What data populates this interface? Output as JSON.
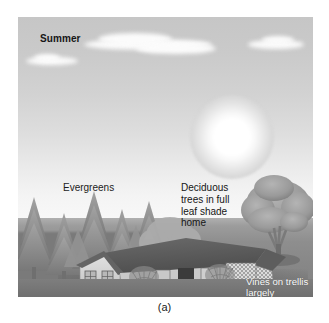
{
  "figure": {
    "caption": "(a)",
    "scene_name": "summer-passive-solar-landscaping"
  },
  "labels": {
    "season": "Summer",
    "evergreens": "Evergreens",
    "deciduous": "Deciduous\ntrees in full\nleaf shade\nhome",
    "vines": "Vines on trellis\nlargely covering\nfront of house"
  },
  "elements": {
    "sun": "sun",
    "clouds": "clouds",
    "sky": "sky",
    "ground": "ground",
    "evergreen_trees": "evergreen-tree-row",
    "deciduous_tree": "deciduous-tree",
    "house": "house",
    "trellis": "trellis"
  },
  "colors": {
    "sky_top": "#c6c6c6",
    "sky_horizon": "#f8f8f8",
    "sun": "#ffffff",
    "cloud": "#fbfbfb",
    "ground": "#8e8e8e",
    "ground_dark": "#7a7a7a",
    "tree_foliage": "#8f8f8f",
    "deciduous_foliage": "#9a9a9a",
    "roof": "#5a5a5a",
    "wall": "#d8d8d8",
    "label_dark": "#161616",
    "label_light": "#fdfdfd"
  }
}
